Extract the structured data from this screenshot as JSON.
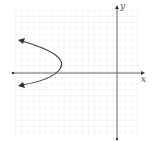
{
  "graph": {
    "type": "coordinate-plane",
    "x_axis_label": "x",
    "y_axis_label": "y",
    "grid": {
      "left": 15,
      "top": 10,
      "right": 139,
      "bottom": 136,
      "cell": 6.1
    },
    "origin_px": {
      "x": 117,
      "y": 73
    },
    "curve": {
      "kind": "parabola-opening-left",
      "vertex_approx": [
        -9,
        1
      ],
      "upper_arrow_approx": [
        -16,
        5.5
      ],
      "lower_arrow_approx": [
        -16,
        -2
      ]
    },
    "colors": {
      "grid": "#e4e4e4",
      "axis": "#555555",
      "curve": "#444444"
    }
  }
}
